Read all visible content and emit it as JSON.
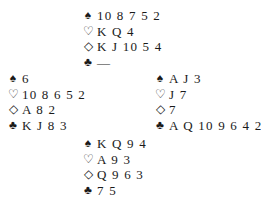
{
  "hands": {
    "north": {
      "spades": "10 8 7 5 2",
      "hearts": "K Q 4",
      "diamonds": "K J 10 5 4",
      "clubs": "—"
    },
    "west": {
      "spades": "6",
      "hearts": "10 8 6 5 2",
      "diamonds": "A 8 2",
      "clubs": "K J 8 3"
    },
    "east": {
      "spades": "A J 3",
      "hearts": "J 7",
      "diamonds": "7",
      "clubs": "A Q 10 9 6 4 2"
    },
    "south": {
      "spades": "K Q 9 4",
      "hearts": "A 9 3",
      "diamonds": "Q 9 6 3",
      "clubs": "7 5"
    }
  },
  "symbols": {
    "spades": "♠",
    "hearts": "♡",
    "diamonds": "◇",
    "clubs": "♣"
  }
}
